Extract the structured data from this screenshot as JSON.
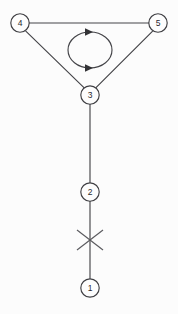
{
  "diagram": {
    "canvas": {
      "width": 178,
      "height": 314,
      "background": "#fcfcfc"
    },
    "style": {
      "edge_color": "#444448",
      "node_stroke": "#3f3f43",
      "node_fill": "#fdfdfd",
      "label_color": "#2a2a2e",
      "arrow_color": "#333336",
      "cut_color": "#5a5a5e",
      "stroke_width": 1.15,
      "node_radius": 9.2
    },
    "nodes": [
      {
        "id": "4",
        "label": "4",
        "cx": 20,
        "cy": 23,
        "name": "node-4"
      },
      {
        "id": "5",
        "label": "5",
        "cx": 158,
        "cy": 23,
        "name": "node-5"
      },
      {
        "id": "3",
        "label": "3",
        "cx": 90,
        "cy": 95,
        "name": "node-3"
      },
      {
        "id": "2",
        "label": "2",
        "cx": 90,
        "cy": 192,
        "name": "node-2"
      },
      {
        "id": "1",
        "label": "1",
        "cx": 90,
        "cy": 288,
        "name": "node-1"
      }
    ],
    "edges": [
      {
        "id": "e45",
        "from": "4",
        "to": "5",
        "name": "edge-4-5",
        "x1": 29.2,
        "y1": 23,
        "x2": 148.8,
        "y2": 23
      },
      {
        "id": "e43",
        "from": "4",
        "to": "3",
        "name": "edge-4-3",
        "x1": 25.8,
        "y1": 31.2,
        "x2": 84.2,
        "y2": 87.8
      },
      {
        "id": "e53",
        "from": "5",
        "to": "3",
        "name": "edge-5-3",
        "x1": 152.4,
        "y1": 31.4,
        "x2": 96.0,
        "y2": 87.6
      },
      {
        "id": "e32",
        "from": "3",
        "to": "2",
        "name": "edge-3-2",
        "x1": 90,
        "y1": 104.2,
        "x2": 90,
        "y2": 182.8
      },
      {
        "id": "e21",
        "from": "2",
        "to": "1",
        "name": "edge-2-1",
        "x1": 90,
        "y1": 201.2,
        "x2": 90,
        "y2": 278.8
      }
    ],
    "self_loop": {
      "name": "self-loop-ellipse",
      "cx": 90,
      "cy": 50,
      "rx": 22,
      "ry": 18,
      "direction": "clockwise",
      "arrows": [
        {
          "name": "loop-arrow-top",
          "x": 90,
          "y": 32,
          "points": "85,28.2 93,32.0 85,35.8"
        },
        {
          "name": "loop-arrow-bottom",
          "x": 90,
          "y": 68,
          "points": "85,64.2 93,68.0 85,71.8"
        }
      ]
    },
    "cut_mark": {
      "name": "cut-mark-x",
      "cx": 90,
      "cy": 240,
      "half_width": 13,
      "half_height": 10,
      "segments": [
        {
          "x1": 77,
          "y1": 230,
          "x2": 103,
          "y2": 250
        },
        {
          "x1": 103,
          "y1": 230,
          "x2": 77,
          "y2": 250
        }
      ]
    }
  }
}
